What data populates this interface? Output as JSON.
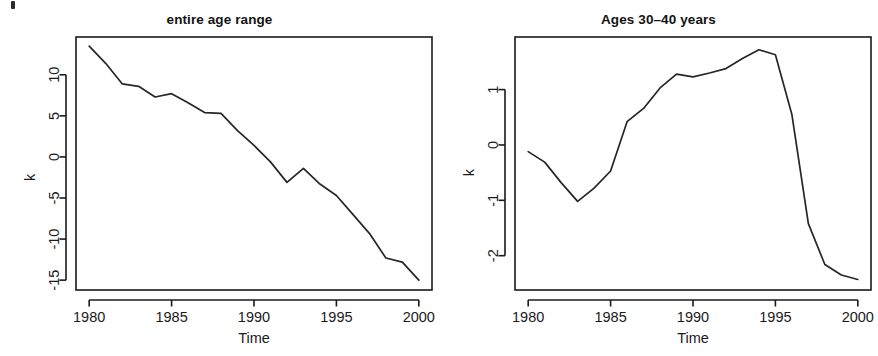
{
  "figure": {
    "background": "#ffffff",
    "line_color": "#262626",
    "axis_color": "#1a1a1a",
    "panel_count": 2
  },
  "panels": [
    {
      "id": "left",
      "title": "entire age range",
      "xlabel": "Time",
      "ylabel": "k"
    },
    {
      "id": "right",
      "title": "Ages 30-40 years",
      "title_display": "Ages 30–40 years",
      "xlabel": "Time",
      "ylabel": "k"
    }
  ],
  "chart_data": [
    {
      "type": "line",
      "title": "entire age range",
      "xlabel": "Time",
      "ylabel": "k",
      "xlim": [
        1979.2,
        2000.8
      ],
      "ylim": [
        -16.2,
        14.6
      ],
      "xticks": [
        1980,
        1985,
        1990,
        1995,
        2000
      ],
      "xticklabels": [
        "1980",
        "1985",
        "1990",
        "1995",
        "2000"
      ],
      "yticks": [
        10,
        5,
        0,
        -5,
        -10,
        -15
      ],
      "yticklabels": [
        "10",
        "5",
        "0",
        "-5",
        "-10",
        "-15"
      ],
      "grid": false,
      "legend": "none",
      "x": [
        1980,
        1981,
        1982,
        1983,
        1984,
        1985,
        1986,
        1987,
        1988,
        1989,
        1990,
        1991,
        1992,
        1993,
        1994,
        1995,
        1996,
        1997,
        1998,
        1999,
        2000
      ],
      "values": [
        13.5,
        11.4,
        8.9,
        8.6,
        7.3,
        7.7,
        6.6,
        5.4,
        5.3,
        3.2,
        1.4,
        -0.6,
        -3.1,
        -1.4,
        -3.3,
        -4.7,
        -7.0,
        -9.3,
        -12.3,
        -12.8,
        -15.0
      ],
      "series": [
        {
          "name": "k (entire age range)",
          "values": [
            13.5,
            11.4,
            8.9,
            8.6,
            7.3,
            7.7,
            6.6,
            5.4,
            5.3,
            3.2,
            1.4,
            -0.6,
            -3.1,
            -1.4,
            -3.3,
            -4.7,
            -7.0,
            -9.3,
            -12.3,
            -12.8,
            -15.0
          ]
        }
      ]
    },
    {
      "type": "line",
      "title": "Ages 30-40 years",
      "xlabel": "Time",
      "ylabel": "k",
      "xlim": [
        1979.2,
        2000.8
      ],
      "ylim": [
        -2.62,
        1.95
      ],
      "xticks": [
        1980,
        1985,
        1990,
        1995,
        2000
      ],
      "xticklabels": [
        "1980",
        "1985",
        "1990",
        "1995",
        "2000"
      ],
      "yticks": [
        1,
        0,
        -1,
        -2
      ],
      "yticklabels": [
        "1",
        "0",
        "-1",
        "-2"
      ],
      "grid": false,
      "legend": "none",
      "x": [
        1980,
        1981,
        1982,
        1983,
        1984,
        1985,
        1986,
        1987,
        1988,
        1989,
        1990,
        1991,
        1992,
        1993,
        1994,
        1995,
        1996,
        1997,
        1998,
        1999,
        2000
      ],
      "values": [
        -0.12,
        -0.31,
        -0.68,
        -1.02,
        -0.78,
        -0.47,
        0.42,
        0.66,
        1.03,
        1.28,
        1.23,
        1.3,
        1.38,
        1.56,
        1.72,
        1.63,
        0.55,
        -1.42,
        -2.16,
        -2.35,
        -2.43
      ],
      "series": [
        {
          "name": "k (ages 30-40 years)",
          "values": [
            -0.12,
            -0.31,
            -0.68,
            -1.02,
            -0.78,
            -0.47,
            0.42,
            0.66,
            1.03,
            1.28,
            1.23,
            1.3,
            1.38,
            1.56,
            1.72,
            1.63,
            0.55,
            -1.42,
            -2.16,
            -2.35,
            -2.43
          ]
        }
      ]
    }
  ]
}
